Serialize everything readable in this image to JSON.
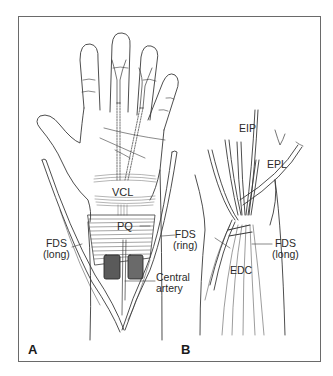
{
  "figure": {
    "panels": [
      {
        "id": "A",
        "label": "A",
        "view": "palmar hand and wrist"
      },
      {
        "id": "B",
        "label": "B",
        "view": "dorsal wrist"
      }
    ],
    "panel_a": {
      "labels": {
        "vcl": "VCL",
        "pq": "PQ",
        "fds_long_line1": "FDS",
        "fds_long_line2": "(long)",
        "fds_ring_line1": "FDS",
        "fds_ring_line2": "(ring)",
        "central_artery_line1": "Central",
        "central_artery_line2": "artery"
      }
    },
    "panel_b": {
      "labels": {
        "eip": "EIP",
        "epl": "EPL",
        "fds_long_line1": "FDS",
        "fds_long_line2": "(long)",
        "edc": "EDC"
      }
    },
    "colors": {
      "line": "#3a3a3a",
      "frame": "#6a6a6a",
      "hatch": "#555555",
      "background": "#ffffff"
    }
  }
}
